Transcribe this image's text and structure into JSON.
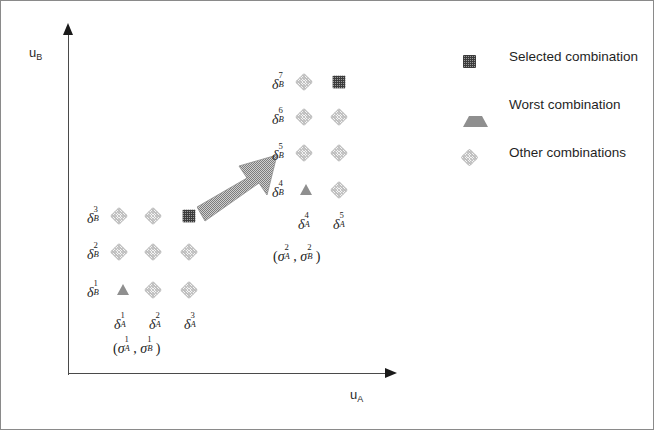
{
  "figure": {
    "axes": {
      "y_label_main": "u",
      "y_label_sub": "B",
      "x_label_main": "u",
      "x_label_sub": "A"
    },
    "legend": {
      "items": [
        {
          "marker": "selected-square-icon",
          "label": "Selected combination",
          "color": "#3b3b3b"
        },
        {
          "marker": "worst-triangle-icon",
          "label": "Worst combination",
          "color": "#8f8f8f"
        },
        {
          "marker": "other-diamond-icon",
          "label": "Other combinations",
          "color": "#c6c6c6"
        }
      ]
    },
    "clusters": [
      {
        "name": "lower-left-cluster",
        "annotation": "(σ¹ᴀ, σ¹ʙ)",
        "annotation_parts": {
          "open": "(",
          "sym1": "σ",
          "sup1": "1",
          "sub1": "A",
          "comma": ", ",
          "sym2": "σ",
          "sup2": "1",
          "sub2": "B",
          "close": ")"
        },
        "row_labels": [
          {
            "sym": "δ",
            "sup": "3",
            "sub": "B"
          },
          {
            "sym": "δ",
            "sup": "2",
            "sub": "B"
          },
          {
            "sym": "δ",
            "sup": "1",
            "sub": "B"
          }
        ],
        "col_labels": [
          {
            "sym": "δ",
            "sup": "1",
            "sub": "A"
          },
          {
            "sym": "δ",
            "sup": "2",
            "sub": "A"
          },
          {
            "sym": "δ",
            "sup": "3",
            "sub": "A"
          }
        ],
        "points": [
          {
            "x": 118,
            "y": 215,
            "type": "other"
          },
          {
            "x": 152,
            "y": 215,
            "type": "other"
          },
          {
            "x": 188,
            "y": 215,
            "type": "selected"
          },
          {
            "x": 118,
            "y": 251,
            "type": "other"
          },
          {
            "x": 152,
            "y": 251,
            "type": "other"
          },
          {
            "x": 188,
            "y": 251,
            "type": "other"
          },
          {
            "x": 122,
            "y": 289,
            "type": "worst"
          },
          {
            "x": 152,
            "y": 289,
            "type": "other"
          },
          {
            "x": 188,
            "y": 289,
            "type": "other"
          }
        ]
      },
      {
        "name": "upper-right-cluster",
        "annotation": "(σ²ᴀ, σ²ʙ)",
        "annotation_parts": {
          "open": "(",
          "sym1": "σ",
          "sup1": "2",
          "sub1": "A",
          "comma": ", ",
          "sym2": "σ",
          "sup2": "2",
          "sub2": "B",
          "close": ")"
        },
        "row_labels": [
          {
            "sym": "δ",
            "sup": "7",
            "sub": "B"
          },
          {
            "sym": "δ",
            "sup": "6",
            "sub": "B"
          },
          {
            "sym": "δ",
            "sup": "5",
            "sub": "B"
          },
          {
            "sym": "δ",
            "sup": "4",
            "sub": "B"
          }
        ],
        "col_labels": [
          {
            "sym": "δ",
            "sup": "4",
            "sub": "A"
          },
          {
            "sym": "δ",
            "sup": "5",
            "sub": "A"
          }
        ],
        "points": [
          {
            "x": 303,
            "y": 81,
            "type": "other"
          },
          {
            "x": 338,
            "y": 81,
            "type": "selected"
          },
          {
            "x": 303,
            "y": 116,
            "type": "other"
          },
          {
            "x": 338,
            "y": 116,
            "type": "other"
          },
          {
            "x": 303,
            "y": 152,
            "type": "other"
          },
          {
            "x": 338,
            "y": 152,
            "type": "other"
          },
          {
            "x": 305,
            "y": 189,
            "type": "worst"
          },
          {
            "x": 338,
            "y": 189,
            "type": "other"
          }
        ]
      }
    ],
    "flow_arrow": {
      "name": "transition-arrow",
      "direction": "up-right",
      "fill": "#9c9c9c"
    }
  }
}
